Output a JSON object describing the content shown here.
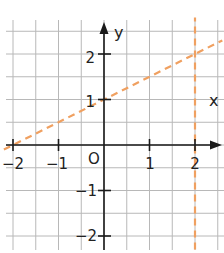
{
  "chart_data": {
    "type": "line",
    "title": "",
    "xlabel": "x",
    "ylabel": "y",
    "origin_label": "O",
    "xlim": [
      -2.2,
      2.6
    ],
    "ylim": [
      -2.3,
      2.8
    ],
    "grid": true,
    "grid_step": 0.5,
    "x_ticks": [
      -2,
      -1,
      1,
      2
    ],
    "x_tick_labels": [
      "−2",
      "−1",
      "1",
      "2"
    ],
    "y_ticks": [
      2,
      1,
      -1,
      -2
    ],
    "y_tick_labels": [
      "2",
      "1",
      "−1",
      "−2"
    ],
    "series": [
      {
        "name": "y = x/2 + 1",
        "style": "dashed",
        "color": "#f0a060",
        "x": [
          -2.2,
          -2,
          0,
          2,
          2.6
        ],
        "y": [
          -0.1,
          0,
          1,
          2,
          2.3
        ]
      },
      {
        "name": "x = 2",
        "style": "dashed",
        "color": "#f0a060",
        "x": [
          2,
          2
        ],
        "y": [
          -2.3,
          2.8
        ]
      }
    ]
  },
  "colors": {
    "grid": "#b8b8b8",
    "axis": "#1a1a1a",
    "dashed_line": "#f0a060"
  }
}
